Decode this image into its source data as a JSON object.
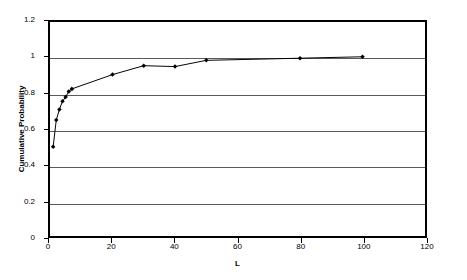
{
  "chart_data": {
    "type": "line",
    "title": "",
    "xlabel": "L",
    "ylabel": "Cumulative Probability",
    "xlim": [
      0,
      120
    ],
    "ylim": [
      0,
      1.2
    ],
    "xticks": [
      0,
      20,
      40,
      60,
      80,
      100,
      120
    ],
    "xtick_labels": [
      "0",
      "20",
      "40",
      "60",
      "80",
      "100",
      "120"
    ],
    "yticks": [
      0,
      0.2,
      0.4,
      0.6,
      0.8,
      1,
      1.2
    ],
    "ytick_labels": [
      "0",
      "0.2",
      "0.4",
      "0.6",
      "0.8",
      "1",
      "1.2"
    ],
    "grid": "horizontal",
    "legend": "none",
    "marker": "filled-diamond",
    "line_color": "#000000",
    "marker_color": "#000000",
    "grid_color": "#5a5a5a",
    "background": "#ffffff",
    "series": [
      {
        "name": "Cumulative Probability",
        "x": [
          1,
          2,
          3,
          4,
          5,
          6,
          7,
          20,
          30,
          40,
          50,
          80,
          100
        ],
        "y": [
          0.5,
          0.65,
          0.71,
          0.755,
          0.78,
          0.81,
          0.825,
          0.905,
          0.955,
          0.95,
          0.985,
          0.997,
          1.005
        ]
      }
    ]
  }
}
